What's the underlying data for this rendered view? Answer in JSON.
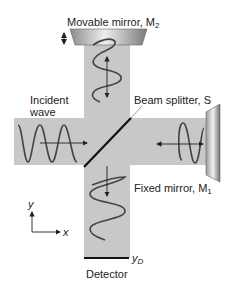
{
  "diagram": {
    "labels": {
      "movable_mirror": "Movable mirror, M",
      "movable_mirror_sub": "2",
      "incident_wave_line1": "Incident",
      "incident_wave_line2": "wave",
      "beam_splitter": "Beam splitter, S",
      "fixed_mirror": "Fixed mirror, M",
      "fixed_mirror_sub": "1",
      "detector": "Detector",
      "detector_position": "y",
      "detector_position_sub": "D",
      "axis_x": "x",
      "axis_y": "y"
    },
    "colors": {
      "beam": "#c8c8c8",
      "wave": "#444444",
      "splitter": "#111111",
      "mirror_light": "#e6e6e6",
      "mirror_dark": "#8a8a8a",
      "text": "#222222"
    }
  }
}
